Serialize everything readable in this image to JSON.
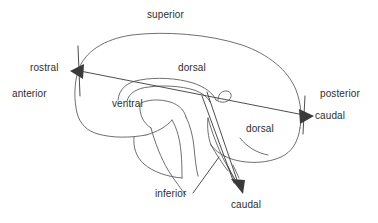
{
  "figure": {
    "stroke_color": "#4a4a4a",
    "text_color": "#2e2e2e",
    "arrow_fill": "#3a3a3a",
    "background_color": "#ffffff"
  },
  "labels": {
    "superior": "superior",
    "rostral": "rostral",
    "anterior": "anterior",
    "dorsal_forebrain": "dorsal",
    "ventral": "ventral",
    "posterior": "posterior",
    "caudal_horizontal": "caudal",
    "dorsal_brainstem": "dorsal",
    "inferior": "inferior",
    "caudal_vertical": "caudal"
  },
  "axes": [
    {
      "name": "neuraxis-forebrain",
      "description": "horizontal axis through the forebrain",
      "from_label": "rostral",
      "to_label": "caudal",
      "arrowheads": "both"
    },
    {
      "name": "neuraxis-brainstem",
      "description": "axis bending downward through the brainstem",
      "to_label": "caudal",
      "arrowheads": "end"
    }
  ],
  "icons": {
    "arrow_left": "arrow-left-icon",
    "arrow_right": "arrow-right-icon",
    "arrow_down": "arrow-down-icon"
  }
}
